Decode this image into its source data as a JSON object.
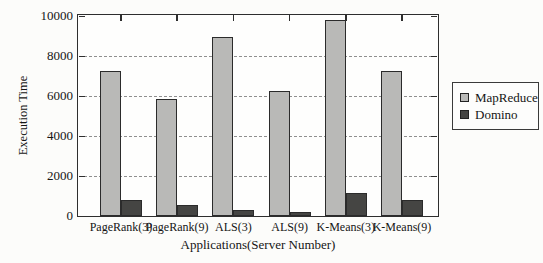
{
  "chart_data": {
    "type": "bar",
    "title": "",
    "categories": [
      "PageRank(3)",
      "PageRank(9)",
      "ALS(3)",
      "ALS(9)",
      "K-Means(3)",
      "K-Means(9)"
    ],
    "series": [
      {
        "name": "MapReduce",
        "color": "#b9b9b7",
        "values": [
          7250,
          5850,
          8950,
          6250,
          9800,
          7250
        ]
      },
      {
        "name": "Domino",
        "color": "#454543",
        "values": [
          800,
          550,
          300,
          200,
          1150,
          800
        ]
      }
    ],
    "xlabel": "Applications(Server Number)",
    "ylabel": "Execution Time",
    "ylim": [
      0,
      10000
    ],
    "yticks": [
      0,
      2000,
      4000,
      6000,
      8000,
      10000
    ],
    "grid": "horizontal-dashed",
    "legend_position": "right",
    "colors": {
      "frame": "#2e2e2e",
      "gridline": "#8f8f8f",
      "background": "#fcfcfa",
      "text": "#151515"
    }
  }
}
